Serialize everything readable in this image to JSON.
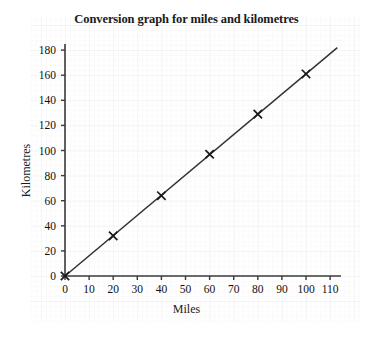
{
  "chart_data": {
    "type": "line",
    "title": "Conversion graph for miles and kilometres",
    "xlabel": "Miles",
    "ylabel": "Kilometres",
    "xlim": [
      0,
      113
    ],
    "ylim": [
      0,
      185
    ],
    "xticks": [
      0,
      10,
      20,
      30,
      40,
      50,
      60,
      70,
      80,
      90,
      100,
      110
    ],
    "yticks": [
      0,
      20,
      40,
      60,
      80,
      100,
      120,
      140,
      160,
      180
    ],
    "grid": true,
    "legend": null,
    "series": [
      {
        "name": "miles to kilometres",
        "marker": "x",
        "line_color": "#333333",
        "x": [
          0,
          20,
          40,
          60,
          80,
          100
        ],
        "y": [
          0,
          32,
          64,
          97,
          129,
          161
        ]
      }
    ],
    "line_extent": {
      "x_start": 0,
      "y_start": 0,
      "x_end": 113,
      "y_end": 182
    },
    "annotations": []
  },
  "axes": {
    "x_tick_labels": [
      "0",
      "10",
      "20",
      "30",
      "40",
      "50",
      "60",
      "70",
      "80",
      "90",
      "100",
      "110"
    ],
    "y_tick_labels": [
      "0",
      "20",
      "40",
      "60",
      "80",
      "100",
      "120",
      "140",
      "160",
      "180"
    ]
  },
  "colors": {
    "axis": "#3a3a3a",
    "line": "#333333",
    "marker": "#1a1a1a",
    "grid_minor": "#fafafa",
    "grid_major": "#f4f4f4",
    "background": "#ffffff"
  }
}
